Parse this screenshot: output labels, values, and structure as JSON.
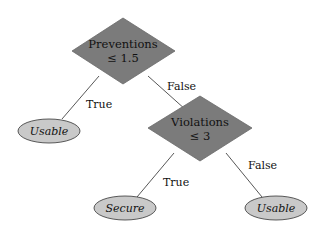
{
  "diagram": {
    "type": "decision-tree",
    "colors": {
      "decision_fill": "#7b7b7b",
      "leaf_fill": "#c9c9c9",
      "edge": "#444444",
      "text": "#111111"
    },
    "nodes": {
      "root": {
        "line1": "Preventions",
        "line2": "≤ 1.5"
      },
      "violations": {
        "line1": "Violations",
        "line2": "≤ 3"
      },
      "leaf_usable_left": {
        "label": "Usable"
      },
      "leaf_secure": {
        "label": "Secure"
      },
      "leaf_usable_right": {
        "label": "Usable"
      }
    },
    "edges": {
      "root_true": {
        "label": "True"
      },
      "root_false": {
        "label": "False"
      },
      "violations_true": {
        "label": "True"
      },
      "violations_false": {
        "label": "False"
      }
    }
  }
}
